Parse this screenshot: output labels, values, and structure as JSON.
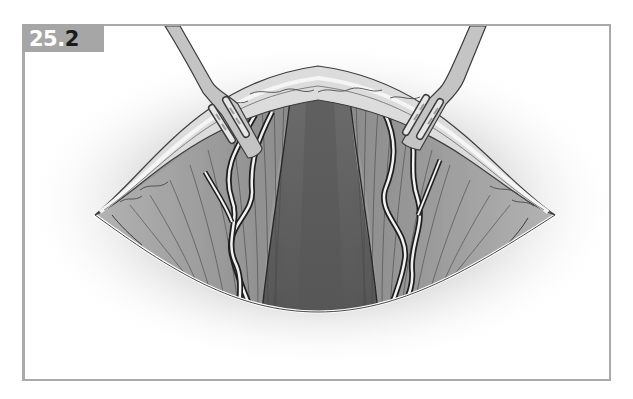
{
  "figure": {
    "label_prefix": "25.",
    "label_suffix": "2",
    "colors": {
      "frame_border": "#a9a9a9",
      "label_bg": "#a6a6a6",
      "label_text_light": "#ffffff",
      "label_text_dark": "#1a1a1a",
      "halo": "#d8d8d8",
      "skin_flap": "#d9d9d9",
      "muscle_light": "#a8a8a8",
      "muscle_mid": "#8e8e8e",
      "center_dark": "#5e5e5e",
      "retractor": "#c2c2c2",
      "outline": "#3a3a3a"
    },
    "elements": {
      "left_retractor": "retractor-icon",
      "right_retractor": "retractor-icon",
      "incision": "incision-opening",
      "vessels": "vessel-icon"
    }
  }
}
